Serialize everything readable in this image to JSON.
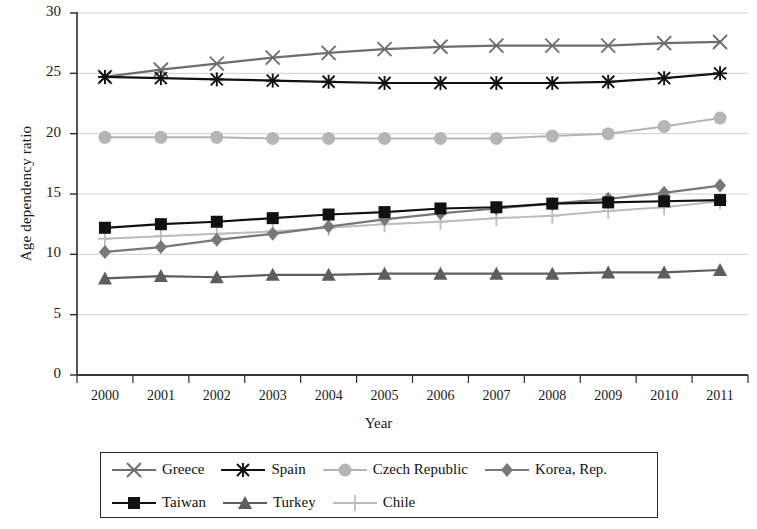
{
  "chart_data": {
    "type": "line",
    "title": "",
    "xlabel": "Year",
    "ylabel": "Age dependency ratio",
    "categories": [
      "2000",
      "2001",
      "2002",
      "2003",
      "2004",
      "2005",
      "2006",
      "2007",
      "2008",
      "2009",
      "2010",
      "2011"
    ],
    "ylim": [
      0,
      30
    ],
    "yticks": [
      0,
      5,
      10,
      15,
      20,
      25,
      30
    ],
    "grid": true,
    "legend_position": "bottom",
    "series": [
      {
        "name": "Greece",
        "marker": "x-cross",
        "color": "#6e6e6e",
        "values": [
          24.7,
          25.3,
          25.8,
          26.3,
          26.7,
          27.0,
          27.2,
          27.3,
          27.3,
          27.3,
          27.5,
          27.6
        ]
      },
      {
        "name": "Spain",
        "marker": "asterisk",
        "color": "#111111",
        "values": [
          24.7,
          24.6,
          24.5,
          24.4,
          24.3,
          24.2,
          24.2,
          24.2,
          24.2,
          24.3,
          24.6,
          25.0
        ]
      },
      {
        "name": "Czech Republic",
        "marker": "circle",
        "color": "#b5b5b5",
        "values": [
          19.7,
          19.7,
          19.7,
          19.6,
          19.6,
          19.6,
          19.6,
          19.6,
          19.8,
          20.0,
          20.6,
          21.3
        ]
      },
      {
        "name": "Korea, Rep.",
        "marker": "diamond",
        "color": "#787878",
        "values": [
          10.2,
          10.6,
          11.2,
          11.7,
          12.3,
          12.9,
          13.4,
          13.8,
          14.2,
          14.6,
          15.1,
          15.7
        ]
      },
      {
        "name": "Taiwan",
        "marker": "square",
        "color": "#111111",
        "values": [
          12.2,
          12.5,
          12.7,
          13.0,
          13.3,
          13.5,
          13.8,
          13.9,
          14.2,
          14.3,
          14.4,
          14.5
        ]
      },
      {
        "name": "Turkey",
        "marker": "triangle",
        "color": "#5d5d5d",
        "values": [
          8.0,
          8.2,
          8.1,
          8.3,
          8.3,
          8.4,
          8.4,
          8.4,
          8.4,
          8.5,
          8.5,
          8.7
        ]
      },
      {
        "name": "Chile",
        "marker": "plus",
        "color": "#bcbcbc",
        "values": [
          11.3,
          11.5,
          11.7,
          11.9,
          12.2,
          12.5,
          12.7,
          13.0,
          13.2,
          13.6,
          13.9,
          14.4
        ]
      }
    ]
  },
  "legend": {
    "rows": [
      [
        "Greece",
        "Spain",
        "Czech Republic",
        "Korea, Rep."
      ],
      [
        "Taiwan",
        "Turkey",
        "Chile"
      ]
    ]
  },
  "axes": {
    "y_title": "Age dependency ratio",
    "x_title": "Year"
  }
}
